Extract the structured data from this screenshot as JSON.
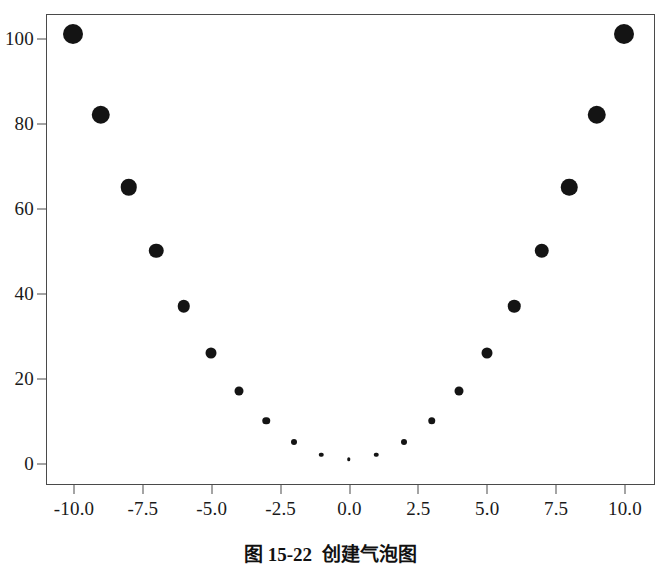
{
  "caption": {
    "number": "图 15-22",
    "title": "创建气泡图",
    "full": "图 15-22    创建气泡图"
  },
  "chart_data": {
    "type": "scatter",
    "variant": "bubble",
    "title": "",
    "xlabel": "",
    "ylabel": "",
    "xlim": [
      -11.0,
      11.0
    ],
    "ylim": [
      -4,
      107
    ],
    "grid": false,
    "legend": null,
    "marker_color": "#141414",
    "frame_color": "#4a4a4a",
    "background": "#ffffff",
    "xticks": [
      "-10.0",
      "-7.5",
      "-5.0",
      "-2.5",
      "0.0",
      "2.5",
      "5.0",
      "7.5",
      "10.0"
    ],
    "xtick_values": [
      -10.0,
      -7.5,
      -5.0,
      -2.5,
      0.0,
      2.5,
      5.0,
      7.5,
      10.0
    ],
    "yticks": [
      "0",
      "20",
      "40",
      "60",
      "80",
      "100"
    ],
    "ytick_values": [
      0,
      20,
      40,
      60,
      80,
      100
    ],
    "x": [
      -10,
      -9,
      -8,
      -7,
      -6,
      -5,
      -4,
      -3,
      -2,
      -1,
      0,
      1,
      2,
      3,
      4,
      5,
      6,
      7,
      8,
      9,
      10
    ],
    "y": [
      101,
      82,
      65,
      50,
      37,
      26,
      17,
      10,
      5,
      2,
      1,
      2,
      5,
      10,
      17,
      26,
      37,
      50,
      65,
      82,
      101
    ],
    "sizes": [
      20,
      18.5,
      16.5,
      14.5,
      12.5,
      11,
      9,
      7.5,
      6,
      4.5,
      3.5,
      4.5,
      6,
      7.5,
      9,
      11,
      12.5,
      14.5,
      16.5,
      18.5,
      20
    ],
    "size_field": "|x| (bubble radius scales with distance from zero)",
    "relation": "y = x^2 + 1"
  }
}
